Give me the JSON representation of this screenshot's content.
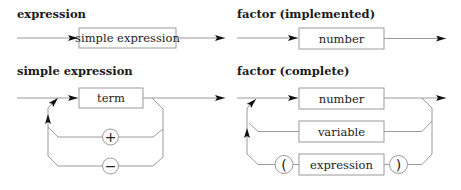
{
  "diagrams": {
    "expression": {
      "title": "expression",
      "boxes": [
        "simple expression"
      ]
    },
    "factor_implemented": {
      "title": "factor (implemented)",
      "boxes": [
        "number"
      ]
    },
    "simple_expression": {
      "title": "simple expression",
      "boxes": [
        "term"
      ],
      "operators": [
        "+",
        "−"
      ]
    },
    "factor_complete": {
      "title": "factor (complete)",
      "boxes": [
        "number",
        "variable",
        "expression"
      ],
      "parens": [
        "(",
        ")"
      ]
    }
  },
  "colors": {
    "line": "#9a9a9a",
    "arrow": "#111111",
    "text": "#222222"
  }
}
